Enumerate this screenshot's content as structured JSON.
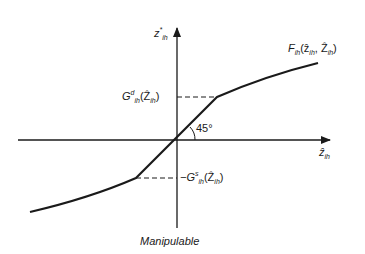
{
  "diagram": {
    "caption": "Manipulable",
    "axes": {
      "y_label_base": "z",
      "y_label_sup": "*",
      "y_label_sub": "ih",
      "x_label_base": "ẑ",
      "x_label_sub": "ih"
    },
    "curve_label": {
      "base": "F",
      "sub": "ih",
      "args": "(ẑ",
      "args_sub1": "ih",
      "args_mid": ", Ẑ",
      "args_sub2": "ih",
      "args_end": ")"
    },
    "upper_threshold_label": {
      "base": "G",
      "sup": "d",
      "sub": "ih",
      "args": "(Ẑ",
      "args_sub": "ih",
      "args_end": ")"
    },
    "lower_threshold_label": {
      "prefix": "−G",
      "sup": "s",
      "sub": "ih",
      "args": "(Ẑ",
      "args_sub": "ih",
      "args_end": ")"
    },
    "angle_label": "45°",
    "colors": {
      "line": "#1a1a1a",
      "background": "#ffffff"
    }
  }
}
